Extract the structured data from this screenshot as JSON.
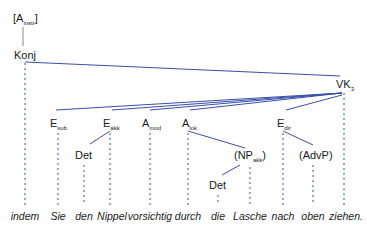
{
  "diagram": {
    "type": "dependency-tree",
    "line_color": "#3a4fa8",
    "dash_color": "#3a4fa8",
    "root": {
      "label": "A",
      "sub": "instr"
    },
    "conj": {
      "label": "Konj"
    },
    "verb": {
      "label": "VK",
      "sub": "3"
    },
    "dependents": [
      {
        "label": "E",
        "sub": "sub"
      },
      {
        "label": "E",
        "sub": "akk"
      },
      {
        "label": "A",
        "sub": "mod"
      },
      {
        "label": "A",
        "sub": "lok"
      },
      {
        "label": "E",
        "sub": "dir"
      }
    ],
    "subnodes": {
      "det1": "Det",
      "np": {
        "label": "(NP",
        "sub": "akk",
        "close": ")"
      },
      "advp": "(AdvP)",
      "det2": "Det"
    },
    "words": [
      "indem",
      "Sie",
      "den",
      "Nippel",
      "vorsichtig",
      "durch",
      "die",
      "Lasche",
      "nach",
      "oben",
      "ziehen."
    ]
  }
}
